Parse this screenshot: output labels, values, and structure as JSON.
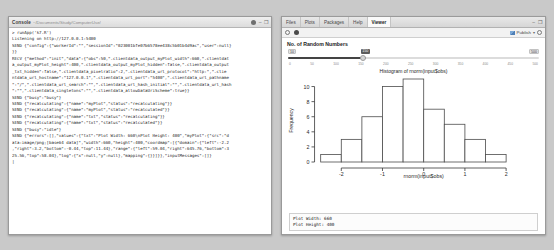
{
  "console": {
    "title": "Console",
    "path": "~/Documents/Study/ComputerUse/",
    "tab_icon": "console-tab-icon",
    "minimize_label": "–",
    "maximize_label": "❐",
    "dot_icon": "record-dot-icon",
    "lines": [
      "> runApp('k7.R')",
      "",
      "Listening on http://127.0.0.1:5400",
      "SEND {\"config\":{\"workerId\":\"\",\"sessionId\":\"023001bfe07b6578ee438c5b01b4d9ac\",\"user\":null}",
      "}}",
      "RECV {\"method\":\"init\",\"data\":{\"obs\":50,\".clientdata_output_myPlot_width\":660,\".clientdat",
      "a_output_myPlot_height\":400,\".clientdata_output_myPlot_hidden\":false,\".clientdata_output",
      "_txt_hidden\":false,\".clientdata_pixelratio\":2,\".clientdata_url_protocol\":\"http:\",\".clie",
      "ntdata_url_hostname\":\"127.0.0.1\",\".clientdata_url_port\":\"5400\",\".clientdata_url_pathname",
      "\":\"/\",\".clientdata_url_search\":\"\",\".clientdata_url_hash_initial\":\"\",\".clientdata_url_hash",
      "\":\"\",\".clientdata_singletons\":\"\",\".clientdata_allowDataUriScheme\":true}}",
      "SEND {\"busy\":\"busy\"}",
      "SEND {\"recalculating\":{\"name\":\"myPlot\",\"status\":\"recalculating\"}}",
      "SEND {\"recalculating\":{\"name\":\"myPlot\",\"status\":\"recalculated\"}}",
      "SEND {\"recalculating\":{\"name\":\"txt\",\"status\":\"recalculating\"}}",
      "SEND {\"recalculating\":{\"name\":\"txt\",\"status\":\"recalculated\"}}",
      "SEND {\"busy\":\"idle\"}",
      "SEND {\"errors\":[],\"values\":{\"txt\":\"Plot Width: 660\\nPlot Height: 400\",\"myPlot\":{\"src\":\"d",
      "ata:image/png;[base64 data]\",\"width\":660,\"height\":400,\"coordmap\":[{\"domain\":{\"left\":-2.2",
      ",\"right\":3.2,\"bottom\":-0.44,\"top\":11.44},\"range\":{\"left\":59.04,\"right\":645.76,\"bottom\":3",
      "25.56,\"top\":58.04},\"log\":{\"x\":null,\"y\":null},\"mapping\":{}}]}},\"inputMessages\":[]}",
      "|"
    ]
  },
  "viewer": {
    "tabs": [
      {
        "label": "Files",
        "active": false
      },
      {
        "label": "Plots",
        "active": false
      },
      {
        "label": "Packages",
        "active": false
      },
      {
        "label": "Help",
        "active": false
      },
      {
        "label": "Viewer",
        "active": true
      }
    ],
    "window_controls": {
      "minimize": "–",
      "maximize": "❐"
    },
    "toolbar": {
      "back_icon": "back-arrow-icon",
      "refresh_icon": "refresh-icon",
      "publish_icon": "publish-icon",
      "publish_label": "Publish",
      "publish_caret": "▾",
      "settings_icon": "gear-icon"
    },
    "slider": {
      "title": "No. of Random Numbers",
      "min_label": "10",
      "max_label": "500",
      "value_label": "150",
      "ticks": [
        "0",
        "50",
        "100",
        "150",
        "200",
        "250",
        "300",
        "350",
        "400",
        "450",
        "500"
      ]
    },
    "output_text": {
      "line1": "Plot Width: 660",
      "line2": "Plot Height: 400"
    }
  },
  "chart_data": {
    "type": "bar",
    "title": "Histogram of rnorm(input$obs)",
    "xlabel": "rnorm(input$obs)",
    "ylabel": "Frequency",
    "bin_edges": [
      -2.5,
      -2.0,
      -1.5,
      -1.0,
      -0.5,
      0.0,
      0.5,
      1.0,
      1.5,
      2.0,
      2.5
    ],
    "categories": [
      "-2.5",
      "-2.0",
      "-1.5",
      "-1.0",
      "-0.5",
      "0.0",
      "0.5",
      "1.0",
      "1.5",
      "2.0"
    ],
    "values": [
      1,
      3,
      6,
      10,
      11,
      7,
      5,
      3,
      1,
      0
    ],
    "xticks": [
      "-2",
      "-1",
      "0",
      "1",
      "2"
    ],
    "xtick_values": [
      -2,
      -1,
      0,
      1,
      2
    ],
    "yticks": [
      "0",
      "2",
      "4",
      "6",
      "8",
      "10"
    ],
    "ytick_values": [
      0,
      2,
      4,
      6,
      8,
      10
    ],
    "xlim": [
      -2.5,
      2.5
    ],
    "ylim": [
      0,
      11
    ],
    "grid": false,
    "legend": false,
    "bar_color": "#ffffff",
    "bar_edge_color": "#4d4d4d"
  }
}
